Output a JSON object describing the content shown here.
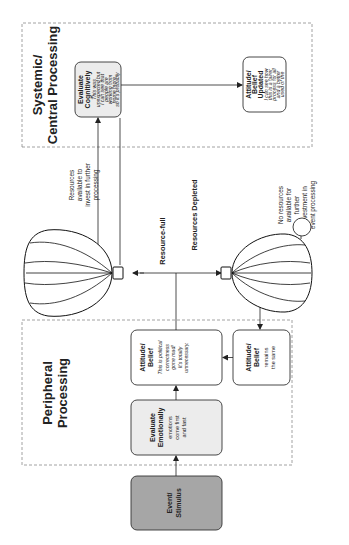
{
  "diagram": {
    "orientation": "rotated-90-ccw",
    "colors": {
      "stimulus_fill": "#a6a6a6",
      "emotional_fill": "#ececec",
      "cognitive_fill": "#ececec",
      "box_fill": "#ffffff",
      "stroke": "#333333",
      "dashed": "#8a8a8a"
    },
    "regions": {
      "peripheral": {
        "title_line1": "Peripheral",
        "title_line2": "Processing"
      },
      "systemic": {
        "title_line1": "Systemic/",
        "title_line2": "Central Processing"
      }
    },
    "nodes": {
      "event": {
        "line1": "Event/",
        "line2": "Stimulus"
      },
      "evaluate_emotionally": {
        "head1": "Evaluate",
        "head2": "Emotionally",
        "body": [
          "emotions",
          "come first",
          "and fast"
        ]
      },
      "attitude_belief": {
        "head1": "Attitude/",
        "head2": "Belief",
        "body": [
          "This is political",
          "correctness",
          "gone mad!",
          "It's totally",
          "unnecessary."
        ]
      },
      "attitude_belief_remains": {
        "head1": "Attitude/",
        "head2": "Belief",
        "body": [
          "remains",
          "the same"
        ]
      },
      "evaluate_cognitively": {
        "head1": "Evaluate",
        "head2": "Cognitively",
        "body": [
          "This was",
          "unexpected but",
          "I can see that",
          "people are",
          "working from",
          "home more,",
          "so it's probably",
          "a good use of",
          "space."
        ]
      },
      "attitude_belief_updated": {
        "head1": "Attitude/",
        "head2": "Belief",
        "head3": "Updated",
        "body": [
          "I can see how",
          "this is a fairer",
          "process for all",
          "and a better",
          "used of the",
          "limited car",
          "park space"
        ]
      }
    },
    "labels": {
      "resource_full": "Resource-full",
      "resources_depleted": "Resources Depleted",
      "resources_available": [
        "Resources",
        "available to",
        "invest in further",
        "processing"
      ],
      "no_resources": [
        "No resources",
        "available for",
        "further",
        "investment in",
        "event processing"
      ]
    },
    "icons": {
      "balloon_full": "hot-air-balloon-icon",
      "balloon_depleted": "deflating-hot-air-balloon-icon"
    }
  }
}
